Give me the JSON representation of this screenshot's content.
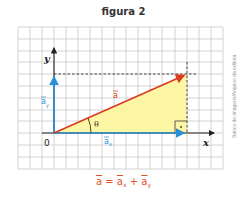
{
  "figure": {
    "title": "figura 2",
    "credit": "Banco de imagens/Arquivo da editora",
    "axes": {
      "x_label": "x",
      "y_label": "y",
      "origin_label": "0"
    },
    "vectors": {
      "a": {
        "label": "a",
        "color": "#d93a20"
      },
      "ax": {
        "label": "a",
        "sub": "x",
        "color": "#2a8fd6"
      },
      "ay": {
        "label": "a",
        "sub": "y",
        "color": "#2a8fd6"
      }
    },
    "angle_label": "θ",
    "right_angle_marker": "·",
    "triangle_fill": "#fdf5a0",
    "grid_color": "#c8c8c8",
    "formula": {
      "lhs": "a",
      "eq": " = ",
      "t1": "a",
      "t1_sub": "x",
      "plus": " + ",
      "t2": "a",
      "t2_sub": "y"
    }
  }
}
